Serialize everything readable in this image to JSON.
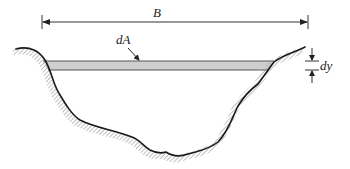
{
  "figure": {
    "labels": {
      "top_width": "B",
      "strip_area": "dA",
      "strip_thickness": "dy"
    },
    "colors": {
      "bank_line": "#1a1a1a",
      "hatching": "#9a9a9a",
      "strip_fill": "#cfcfcf",
      "strip_edge": "#555555",
      "dimension_line": "#333333"
    }
  }
}
